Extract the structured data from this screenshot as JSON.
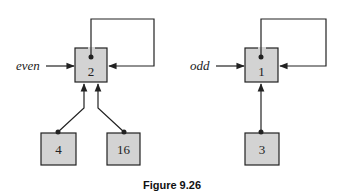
{
  "figure": {
    "caption": "Figure 9.26",
    "trees": [
      {
        "name": "even",
        "root": {
          "value": "2",
          "self_loop": true
        },
        "children": [
          {
            "value": "4"
          },
          {
            "value": "16"
          }
        ]
      },
      {
        "name": "odd",
        "root": {
          "value": "1",
          "self_loop": true
        },
        "children": [
          {
            "value": "3"
          }
        ]
      }
    ]
  },
  "colors": {
    "node_fill": "#d3d3d3",
    "stroke": "#222222",
    "background": "#ffffff"
  }
}
